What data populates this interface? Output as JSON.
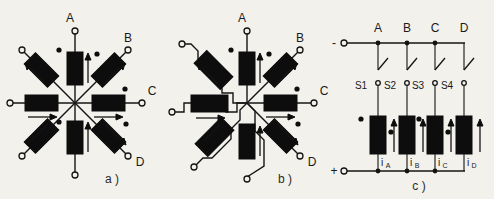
{
  "figure": {
    "background_color": "#f2f1ec",
    "ink_color": "#141414",
    "panels": [
      {
        "id": "a",
        "caption": "a )",
        "type": "star-connected-windings",
        "description": "Eight coils arranged radially in a star (wye) with a common center node; four external terminals A, B, C, D"
      },
      {
        "id": "b",
        "caption": "b )",
        "type": "zigzag-connected-windings",
        "description": "Same eight radial coils but with stepped zigzag interconnections toward the center node"
      },
      {
        "id": "c",
        "caption": "c )",
        "type": "drive-circuit",
        "description": "Four switched phase windings between the negative and positive supply rails"
      }
    ]
  },
  "panel_a": {
    "caption": "a )",
    "terminals": [
      {
        "label": "A",
        "position": "top"
      },
      {
        "label": "B",
        "position": "upper-right"
      },
      {
        "label": "C",
        "position": "right"
      },
      {
        "label": "D",
        "position": "lower-right"
      }
    ],
    "coil_count": 8,
    "free_terminal_count": 4
  },
  "panel_b": {
    "caption": "b )",
    "terminals": [
      {
        "label": "A",
        "position": "top"
      },
      {
        "label": "B",
        "position": "upper-right"
      },
      {
        "label": "C",
        "position": "right"
      },
      {
        "label": "D",
        "position": "lower-right"
      }
    ],
    "coil_count": 8,
    "free_terminal_count": 4
  },
  "panel_c": {
    "caption": "c )",
    "rail_top_label": "-",
    "rail_bottom_label": "+",
    "phases": [
      {
        "node": "A",
        "switch": "S1",
        "current": "i",
        "current_sub": "A",
        "switch_state": "open"
      },
      {
        "node": "B",
        "switch": "S2",
        "current": "i",
        "current_sub": "B",
        "switch_state": "open"
      },
      {
        "node": "C",
        "switch": "S3",
        "current": "i",
        "current_sub": "C",
        "switch_state": "open"
      },
      {
        "node": "D",
        "switch": "S4",
        "current": "i",
        "current_sub": "D",
        "switch_state": "open"
      }
    ]
  }
}
